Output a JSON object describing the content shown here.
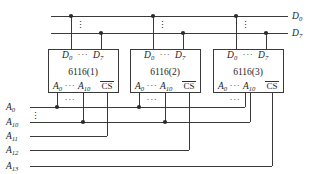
{
  "figure": {
    "wire_color": "#3a3a3a",
    "text_color": "#1b1b1b",
    "background": "#ffffff"
  },
  "data_bus": {
    "lines": [
      {
        "id": "d0",
        "label": "D",
        "sub": "0"
      },
      {
        "id": "d7",
        "label": "D",
        "sub": "7"
      }
    ],
    "ellipsis": "⋮"
  },
  "chips": [
    {
      "id": "chip1",
      "name": "6116(1)",
      "data_left": {
        "label": "D",
        "sub": "0"
      },
      "data_right": {
        "label": "D",
        "sub": "7"
      },
      "data_dots": "···",
      "addr_left": {
        "label": "A",
        "sub": "0"
      },
      "addr_right": {
        "label": "A",
        "sub": "10"
      },
      "addr_dots": "···",
      "cs": "CS"
    },
    {
      "id": "chip2",
      "name": "6116(2)",
      "data_left": {
        "label": "D",
        "sub": "0"
      },
      "data_right": {
        "label": "D",
        "sub": "7"
      },
      "data_dots": "···",
      "addr_left": {
        "label": "A",
        "sub": "0"
      },
      "addr_right": {
        "label": "A",
        "sub": "10"
      },
      "addr_dots": "···",
      "cs": "CS"
    },
    {
      "id": "chip3",
      "name": "6116(3)",
      "data_left": {
        "label": "D",
        "sub": "0"
      },
      "data_right": {
        "label": "D",
        "sub": "7"
      },
      "data_dots": "···",
      "addr_left": {
        "label": "A",
        "sub": "0"
      },
      "addr_right": {
        "label": "A",
        "sub": "10"
      },
      "addr_dots": "···",
      "cs": "CS"
    }
  ],
  "address_bus": {
    "ellipsis": "⋮",
    "lines": [
      {
        "id": "a0",
        "label": "A",
        "sub": "0"
      },
      {
        "id": "a10",
        "label": "A",
        "sub": "10"
      },
      {
        "id": "a11",
        "label": "A",
        "sub": "11"
      },
      {
        "id": "a12",
        "label": "A",
        "sub": "12"
      },
      {
        "id": "a13",
        "label": "A",
        "sub": "13"
      }
    ],
    "inner_dots": "···"
  }
}
